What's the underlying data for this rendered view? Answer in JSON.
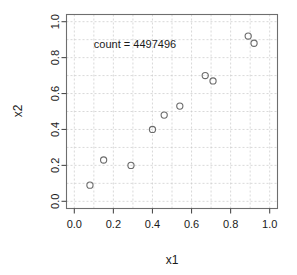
{
  "chart_data": {
    "type": "scatter",
    "title": "",
    "xlabel": "x1",
    "ylabel": "x2",
    "xlim": [
      -0.04,
      1.04
    ],
    "ylim": [
      -0.04,
      1.04
    ],
    "grid": true,
    "legend": null,
    "xticks": [
      "0.0",
      "0.2",
      "0.4",
      "0.6",
      "0.8",
      "1.0"
    ],
    "xtick_values": [
      0.0,
      0.2,
      0.4,
      0.6,
      0.8,
      1.0
    ],
    "yticks": [
      "0.0",
      "0.2",
      "0.4",
      "0.6",
      "0.8",
      "1.0"
    ],
    "ytick_values": [
      0.0,
      0.2,
      0.4,
      0.6,
      0.8,
      1.0
    ],
    "gridline_values": [
      0.0,
      0.1,
      0.2,
      0.3,
      0.4,
      0.5,
      0.6,
      0.7,
      0.8,
      0.9,
      1.0
    ],
    "marker": "open-circle",
    "marker_color": "#6b6b6b",
    "points": [
      {
        "x": 0.08,
        "y": 0.09
      },
      {
        "x": 0.15,
        "y": 0.23
      },
      {
        "x": 0.29,
        "y": 0.2
      },
      {
        "x": 0.4,
        "y": 0.4
      },
      {
        "x": 0.46,
        "y": 0.48
      },
      {
        "x": 0.54,
        "y": 0.53
      },
      {
        "x": 0.67,
        "y": 0.7
      },
      {
        "x": 0.71,
        "y": 0.67
      },
      {
        "x": 0.89,
        "y": 0.92
      },
      {
        "x": 0.92,
        "y": 0.88
      }
    ],
    "annotations": [
      {
        "text": "count = 4497496",
        "x": 0.1,
        "y": 0.855
      }
    ]
  },
  "annotation": {
    "count_label": "count = 4497496"
  },
  "axes": {
    "x_title": "x1",
    "y_title": "x2"
  }
}
